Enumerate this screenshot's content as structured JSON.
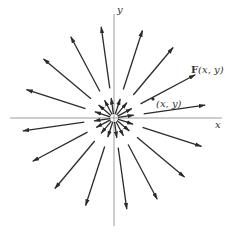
{
  "diagram": {
    "type": "radial-vector-field",
    "axes": {
      "x_label": "x",
      "y_label": "y"
    },
    "annotations": {
      "vector_label_bold": "F",
      "vector_label_args": "(x, y)",
      "point_label": "(x, y)"
    },
    "colors": {
      "axis": "#9a9a9a",
      "arrow": "#2b2b2b",
      "text": "#333333"
    }
  }
}
